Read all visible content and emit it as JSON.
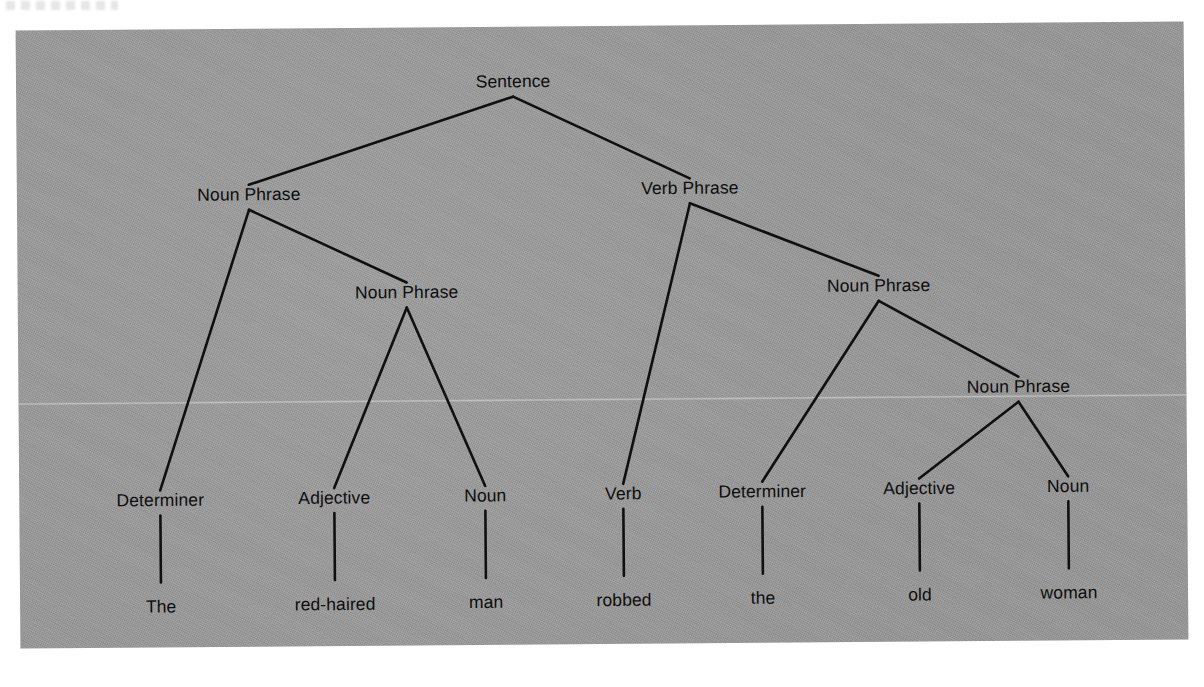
{
  "figure": {
    "kind": "syntax-parse-tree",
    "sentence": "The red-haired man robbed the old woman",
    "background_color": "#9a9a9a",
    "ink_color": "#101010",
    "page_color": "#ffffff"
  },
  "nodes": {
    "root": {
      "label": "Sentence",
      "x": 497,
      "y": 64
    },
    "np_subject": {
      "label": "Noun Phrase",
      "x": 232,
      "y": 175
    },
    "vp": {
      "label": "Verb Phrase",
      "x": 673,
      "y": 172
    },
    "np_subject_inner": {
      "label": "Noun Phrase",
      "x": 389,
      "y": 274
    },
    "np_object": {
      "label": "Noun Phrase",
      "x": 861,
      "y": 271
    },
    "np_object_inner": {
      "label": "Noun Phrase",
      "x": 1000,
      "y": 373
    },
    "det_1": {
      "label": "Determiner",
      "x": 141,
      "y": 480
    },
    "adj_1": {
      "label": "Adjective",
      "x": 315,
      "y": 479
    },
    "noun_1": {
      "label": "Noun",
      "x": 466,
      "y": 478
    },
    "verb": {
      "label": "Verb",
      "x": 604,
      "y": 477
    },
    "det_2": {
      "label": "Determiner",
      "x": 743,
      "y": 476
    },
    "adj_2": {
      "label": "Adjective",
      "x": 900,
      "y": 474
    },
    "noun_2": {
      "label": "Noun",
      "x": 1049,
      "y": 473
    }
  },
  "words": [
    {
      "label": "The",
      "x": 141,
      "y": 569,
      "pos": "Determiner"
    },
    {
      "label": "red-haired",
      "x": 315,
      "y": 568,
      "pos": "Adjective"
    },
    {
      "label": "man",
      "x": 466,
      "y": 567,
      "pos": "Noun"
    },
    {
      "label": "robbed",
      "x": 604,
      "y": 566,
      "pos": "Verb"
    },
    {
      "label": "the",
      "x": 743,
      "y": 565,
      "pos": "Determiner"
    },
    {
      "label": "old",
      "x": 900,
      "y": 563,
      "pos": "Adjective"
    },
    {
      "label": "woman",
      "x": 1049,
      "y": 562,
      "pos": "Noun"
    }
  ],
  "edges": [
    {
      "from": "root",
      "to": "np_subject"
    },
    {
      "from": "root",
      "to": "vp"
    },
    {
      "from": "np_subject",
      "to": "det_1"
    },
    {
      "from": "np_subject",
      "to": "np_subject_inner"
    },
    {
      "from": "np_subject_inner",
      "to": "adj_1"
    },
    {
      "from": "np_subject_inner",
      "to": "noun_1"
    },
    {
      "from": "vp",
      "to": "verb"
    },
    {
      "from": "vp",
      "to": "np_object"
    },
    {
      "from": "np_object",
      "to": "det_2"
    },
    {
      "from": "np_object",
      "to": "np_object_inner"
    },
    {
      "from": "np_object_inner",
      "to": "adj_2"
    },
    {
      "from": "np_object_inner",
      "to": "noun_2"
    }
  ],
  "leaf_stems": [
    {
      "node": "det_1",
      "word": 0
    },
    {
      "node": "adj_1",
      "word": 1
    },
    {
      "node": "noun_1",
      "word": 2
    },
    {
      "node": "verb",
      "word": 3
    },
    {
      "node": "det_2",
      "word": 4
    },
    {
      "node": "adj_2",
      "word": 5
    },
    {
      "node": "noun_2",
      "word": 6
    }
  ]
}
